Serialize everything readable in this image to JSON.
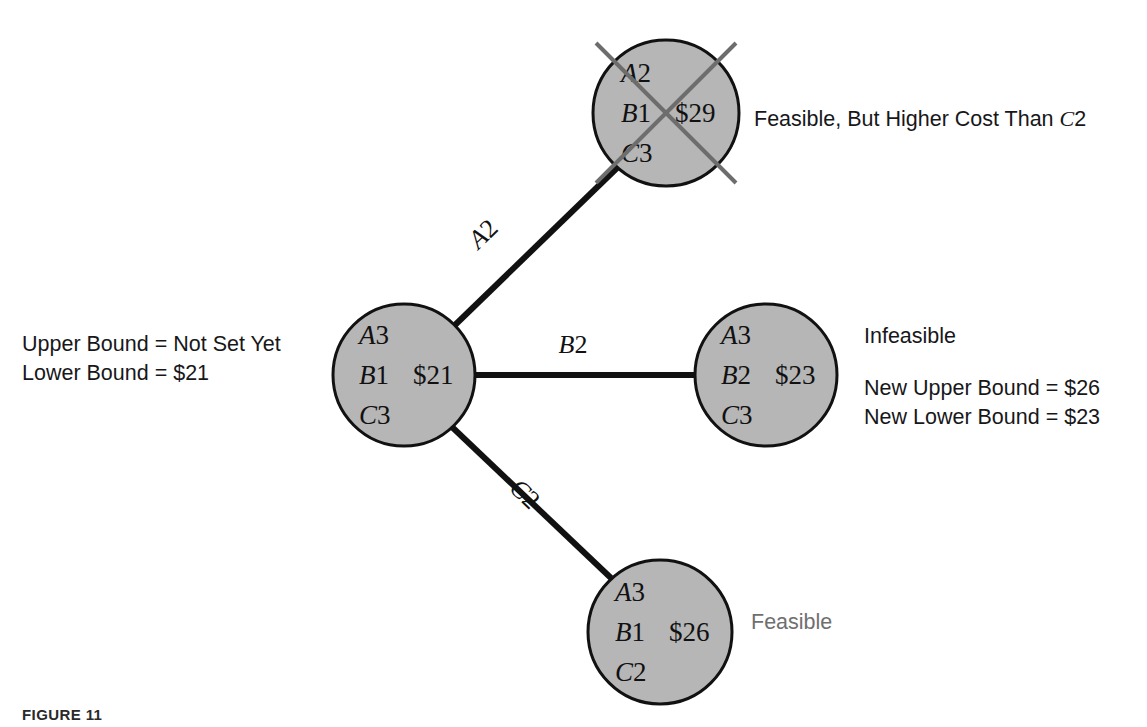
{
  "figure": {
    "caption": "FIGURE 11",
    "background_color": "#ffffff",
    "node_fill_color": "#b6b6b6",
    "node_stroke_color": "#111111",
    "edge_color": "#111111",
    "strike_color": "#6d6d6d",
    "muted_text_color": "#6f6f6f"
  },
  "nodes": {
    "top": {
      "id": "node-top",
      "lines": [
        {
          "var": "A",
          "val": "2"
        },
        {
          "var": "B",
          "val": "1"
        },
        {
          "var": "C",
          "val": "3"
        }
      ],
      "cost": "$29",
      "cx": 666,
      "cy": 113,
      "r": 73,
      "struck_out": true
    },
    "center": {
      "id": "node-center",
      "lines": [
        {
          "var": "A",
          "val": "3"
        },
        {
          "var": "B",
          "val": "1"
        },
        {
          "var": "C",
          "val": "3"
        }
      ],
      "cost": "$21",
      "cx": 404,
      "cy": 375,
      "r": 71,
      "struck_out": false
    },
    "right": {
      "id": "node-right",
      "lines": [
        {
          "var": "A",
          "val": "3"
        },
        {
          "var": "B",
          "val": "2"
        },
        {
          "var": "C",
          "val": "3"
        }
      ],
      "cost": "$23",
      "cx": 766,
      "cy": 375,
      "r": 71,
      "struck_out": false
    },
    "bottom": {
      "id": "node-bottom",
      "lines": [
        {
          "var": "A",
          "val": "3"
        },
        {
          "var": "B",
          "val": "1"
        },
        {
          "var": "C",
          "val": "2"
        }
      ],
      "cost": "$26",
      "cx": 660,
      "cy": 632,
      "r": 72,
      "struck_out": false
    }
  },
  "edges": [
    {
      "id": "edge-a2",
      "label_var": "A",
      "label_val": "2",
      "from": "center",
      "to": "top",
      "x1": 455,
      "y1": 325,
      "x2": 617,
      "y2": 168,
      "label_x": 489,
      "label_y": 240,
      "label_rotation": -44
    },
    {
      "id": "edge-b2",
      "label_var": "B",
      "label_val": "2",
      "from": "center",
      "to": "right",
      "x1": 474,
      "y1": 375,
      "x2": 695,
      "y2": 375,
      "label_x": 573,
      "label_y": 353,
      "label_rotation": 0
    },
    {
      "id": "edge-c2",
      "label_var": "C",
      "label_val": "2",
      "from": "center",
      "to": "bottom",
      "x1": 452,
      "y1": 427,
      "x2": 611,
      "y2": 578,
      "label_x": 519,
      "label_y": 500,
      "label_rotation": 44
    }
  ],
  "annotations": {
    "top_note": {
      "text_before": "Feasible, But Higher Cost Than ",
      "italic_var": "C",
      "text_after": "2"
    },
    "left_bounds": {
      "line1": "Upper Bound = Not Set Yet",
      "line2": "Lower Bound = $21"
    },
    "right_status": {
      "line1": "Infeasible"
    },
    "right_bounds": {
      "line1": "New Upper Bound = $26",
      "line2": "New Lower Bound = $23"
    },
    "bottom_note": {
      "line1": "Feasible"
    }
  }
}
